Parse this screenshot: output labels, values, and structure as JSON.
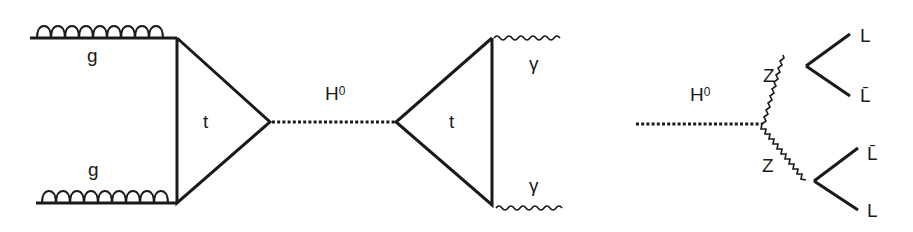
{
  "diagrams": [
    {
      "name": "gluon-fusion-to-diphoton",
      "labels": {
        "gluon_top": "g",
        "gluon_bottom": "g",
        "top_loop_left": "t",
        "higgs": "H",
        "higgs_sup": "0",
        "top_loop_right": "t",
        "photon_top": "γ",
        "photon_bottom": "γ"
      }
    },
    {
      "name": "higgs-to-zz-to-four-leptons",
      "labels": {
        "higgs": "H",
        "higgs_sup": "0",
        "z_top": "Z",
        "z_bottom": "Z",
        "lepton_1": "L",
        "lepton_2": "L̄",
        "lepton_3": "L̄",
        "lepton_4": "L"
      }
    }
  ],
  "colors": {
    "line": "#1a1a1a",
    "background": "#ffffff"
  }
}
